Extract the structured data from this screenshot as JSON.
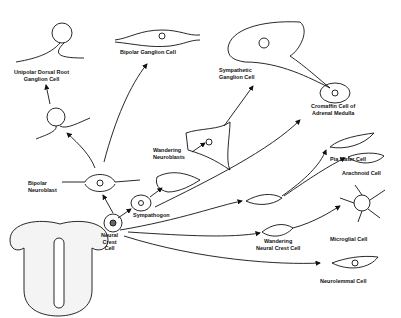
{
  "diagram": {
    "labels": {
      "unipolar": "Unipolar Dorsal Root\nGanglion Cell",
      "bipolar_ganglion": "Bipolar Ganglion Cell",
      "sympathetic": "Sympathetic\nGanglion Cell",
      "chromaffin": "Cromaffin Cell of\nAdrenal Medulla",
      "wandering_neuroblasts": "Wandering\nNeuroblasts",
      "bipolar_neuroblast": "Bipolar\nNeuroblast",
      "sympathogon": "Sympathogon",
      "neural_crest": "Neural\nCrest\nCell",
      "pia_mater": "Pia Mater Cell",
      "arachnoid": "Arachnoid Cell",
      "wandering_crest": "Wandering\nNeural Crest Cell",
      "microglial": "Microglial Cell",
      "neurolemmal": "Neurolemmal Cell"
    }
  }
}
